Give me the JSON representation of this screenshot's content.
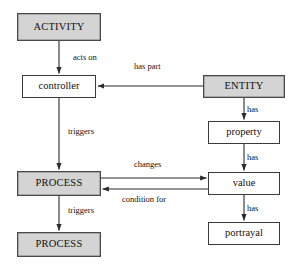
{
  "diagram": {
    "width": 296,
    "height": 272,
    "background": "#ffffff",
    "shaded_fill": "#d4d4d4",
    "plain_fill": "#ffffff",
    "stroke": "#3a3a3a",
    "nodes": [
      {
        "id": "activity",
        "label": "ACTIVITY",
        "style": "shaded",
        "case": "caps",
        "x": 17,
        "y": 13,
        "w": 84,
        "h": 28
      },
      {
        "id": "controller",
        "label": "controller",
        "style": "plain",
        "case": "lower",
        "x": 22,
        "y": 75,
        "w": 74,
        "h": 23
      },
      {
        "id": "entity",
        "label": "ENTITY",
        "style": "shaded",
        "case": "caps",
        "x": 203,
        "y": 75,
        "w": 82,
        "h": 23
      },
      {
        "id": "property",
        "label": "property",
        "style": "plain",
        "case": "lower",
        "x": 208,
        "y": 121,
        "w": 72,
        "h": 23
      },
      {
        "id": "process1",
        "label": "PROCESS",
        "style": "shaded",
        "case": "caps",
        "x": 17,
        "y": 171,
        "w": 84,
        "h": 25
      },
      {
        "id": "value",
        "label": "value",
        "style": "plain",
        "case": "lower",
        "x": 208,
        "y": 172,
        "w": 72,
        "h": 23
      },
      {
        "id": "portrayal",
        "label": "portrayal",
        "style": "plain",
        "case": "lower",
        "x": 208,
        "y": 222,
        "w": 72,
        "h": 23
      },
      {
        "id": "process2",
        "label": "PROCESS",
        "style": "shaded",
        "case": "caps",
        "x": 17,
        "y": 232,
        "w": 84,
        "h": 25
      }
    ],
    "edges": [
      {
        "id": "activity-controller",
        "from": "activity",
        "to": "controller",
        "label": "acts on",
        "label_x": 73,
        "label_y": 53
      },
      {
        "id": "entity-controller",
        "from": "entity",
        "to": "controller",
        "label": "has part",
        "label_x": 134,
        "label_y": 62
      },
      {
        "id": "controller-process1",
        "from": "controller",
        "to": "process1",
        "label": "triggers",
        "label_x": 68,
        "label_y": 127
      },
      {
        "id": "entity-property",
        "from": "entity",
        "to": "property",
        "label": "has",
        "label_x": 247,
        "label_y": 105
      },
      {
        "id": "property-value",
        "from": "property",
        "to": "value",
        "label": "has",
        "label_x": 247,
        "label_y": 153
      },
      {
        "id": "process1-value",
        "from": "process1",
        "to": "value",
        "label": "changes",
        "label_x": 134,
        "label_y": 160
      },
      {
        "id": "value-process1",
        "from": "value",
        "to": "process1",
        "label": "condition for",
        "label_x": 122,
        "label_y": 195
      },
      {
        "id": "value-portrayal",
        "from": "value",
        "to": "portrayal",
        "label": "has",
        "label_x": 247,
        "label_y": 204
      },
      {
        "id": "process1-process2",
        "from": "process1",
        "to": "process2",
        "label": "triggers",
        "label_x": 68,
        "label_y": 206
      }
    ]
  }
}
